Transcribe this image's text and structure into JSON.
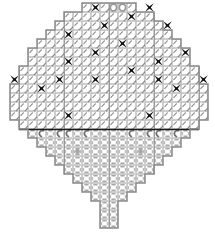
{
  "document": {
    "title": "Needlework Stitch Chart",
    "type": "cross-stitch-pattern-chart"
  },
  "canvas": {
    "width": 215,
    "height": 237,
    "background": "#ffffff"
  },
  "grid": {
    "cell_size": 9,
    "origin_x": 10,
    "origin_y": 3,
    "columns": 22,
    "rows": 25,
    "light_line_color": "#b8b8b8",
    "heavy_line_color": "#6a6a6a",
    "outline_color": "#8a8a8a",
    "center_line_color": "#9a9a9a",
    "midline_color": "#1a1a1a"
  },
  "symbols": {
    "cross": {
      "name": "cross-stitch-symbol",
      "label": "X",
      "color": "#111111",
      "description": "filled four-point star / cross marker"
    },
    "diagonal": {
      "name": "diagonal-stitch-symbol",
      "label": "/",
      "color": "#777777",
      "description": "slanted tapered stitch mark"
    },
    "oval": {
      "name": "oval-stitch-symbol",
      "label": "O",
      "color": "#9a9a9a",
      "description": "small open oval"
    },
    "dash": {
      "name": "dash-stitch-symbol",
      "label": "-",
      "color": "#a8a8a8",
      "description": "short horizontal dash in open grid"
    },
    "hook": {
      "name": "hook-stitch-symbol",
      "label": "c",
      "color": "#6e6e6e",
      "description": "c-shaped hook stitch"
    },
    "dot": {
      "name": "dot-stitch-symbol",
      "label": ".",
      "color": "#9a9a9a",
      "description": "small dot accent"
    }
  },
  "chart_data": {
    "type": "heatmap",
    "title": "Needlework Stitch Chart",
    "xlabel": "",
    "ylabel": "",
    "grid": true,
    "legend_position": "none",
    "categories": [
      "cross",
      "diagonal",
      "oval",
      "dash",
      "hook",
      "dot",
      "empty"
    ],
    "row_extents": [
      {
        "row": 0,
        "c0": 8,
        "c1": 14
      },
      {
        "row": 1,
        "c0": 6,
        "c1": 16
      },
      {
        "row": 2,
        "c0": 5,
        "c1": 17
      },
      {
        "row": 3,
        "c0": 4,
        "c1": 18
      },
      {
        "row": 4,
        "c0": 3,
        "c1": 19
      },
      {
        "row": 5,
        "c0": 2,
        "c1": 20
      },
      {
        "row": 6,
        "c0": 2,
        "c1": 20
      },
      {
        "row": 7,
        "c0": 1,
        "c1": 21
      },
      {
        "row": 8,
        "c0": 1,
        "c1": 21
      },
      {
        "row": 9,
        "c0": 0,
        "c1": 22
      },
      {
        "row": 10,
        "c0": 0,
        "c1": 22
      },
      {
        "row": 11,
        "c0": 0,
        "c1": 22
      },
      {
        "row": 12,
        "c0": 0,
        "c1": 22
      },
      {
        "row": 13,
        "c0": 1,
        "c1": 21
      },
      {
        "row": 14,
        "c0": 2,
        "c1": 20
      },
      {
        "row": 15,
        "c0": 3,
        "c1": 19
      },
      {
        "row": 16,
        "c0": 4,
        "c1": 18
      },
      {
        "row": 17,
        "c0": 5,
        "c1": 17
      },
      {
        "row": 18,
        "c0": 6,
        "c1": 16
      },
      {
        "row": 19,
        "c0": 7,
        "c1": 15
      },
      {
        "row": 20,
        "c0": 8,
        "c1": 14
      },
      {
        "row": 21,
        "c0": 9,
        "c1": 13
      },
      {
        "row": 22,
        "c0": 10,
        "c1": 12
      },
      {
        "row": 23,
        "c0": 10,
        "c1": 12
      },
      {
        "row": 24,
        "c0": 10,
        "c1": 12
      }
    ],
    "midline_row": 13,
    "center_column": 11,
    "cross_cells": [
      [
        0,
        9
      ],
      [
        0,
        15
      ],
      [
        1,
        13
      ],
      [
        2,
        10
      ],
      [
        2,
        17
      ],
      [
        3,
        6
      ],
      [
        4,
        12
      ],
      [
        5,
        9
      ],
      [
        5,
        19
      ],
      [
        6,
        6
      ],
      [
        6,
        16
      ],
      [
        7,
        13
      ],
      [
        8,
        0
      ],
      [
        8,
        5
      ],
      [
        8,
        9
      ],
      [
        8,
        16
      ],
      [
        8,
        21
      ],
      [
        9,
        3
      ],
      [
        9,
        18
      ],
      [
        12,
        6
      ],
      [
        12,
        15
      ]
    ],
    "oval_cells": [
      [
        0,
        11
      ],
      [
        0,
        12
      ]
    ],
    "dot_cells": [
      [
        16,
        7
      ],
      [
        16,
        14
      ]
    ],
    "hook_row": 14,
    "hook_cells": [
      [
        14,
        3
      ],
      [
        14,
        5
      ],
      [
        14,
        6
      ],
      [
        14,
        8
      ],
      [
        14,
        13
      ],
      [
        14,
        15
      ],
      [
        14,
        16
      ],
      [
        14,
        18
      ]
    ],
    "upper_fill": "diagonal",
    "lower_fill": "dash"
  }
}
